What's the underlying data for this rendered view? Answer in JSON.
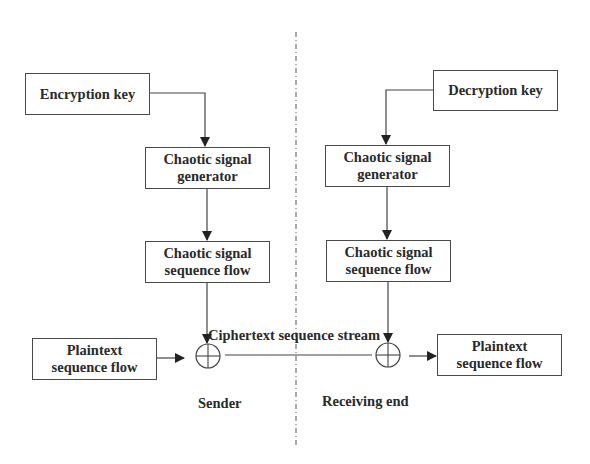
{
  "diagram": {
    "type": "flowchart",
    "divider": "dashed vertical line separating sender and receiver",
    "sender": {
      "label": "Sender",
      "key": "Encryption key",
      "generator": "Chaotic signal generator",
      "generator_lines": [
        "Chaotic signal",
        "generator"
      ],
      "sequence": "Chaotic signal sequence flow",
      "sequence_lines": [
        "Chaotic signal",
        "sequence flow"
      ],
      "plaintext_lines": [
        "Plaintext",
        "sequence flow"
      ]
    },
    "receiver": {
      "label": "Receiving end",
      "key": "Decryption key",
      "generator_lines": [
        "Chaotic signal",
        "generator"
      ],
      "sequence_lines": [
        "Chaotic signal",
        "sequence flow"
      ],
      "plaintext_lines": [
        "Plaintext",
        "sequence flow"
      ]
    },
    "channel_label": "Ciphertext sequence stream",
    "operator": "XOR (⊕)",
    "edges": [
      [
        "Encryption key",
        "Chaotic signal generator (sender)"
      ],
      [
        "Chaotic signal generator (sender)",
        "Chaotic signal sequence flow (sender)"
      ],
      [
        "Chaotic signal sequence flow (sender)",
        "XOR (sender)"
      ],
      [
        "Plaintext sequence flow (sender)",
        "XOR (sender)"
      ],
      [
        "XOR (sender)",
        "XOR (receiver)"
      ],
      [
        "Decryption key",
        "Chaotic signal generator (receiver)"
      ],
      [
        "Chaotic signal generator (receiver)",
        "Chaotic signal sequence flow (receiver)"
      ],
      [
        "Chaotic signal sequence flow (receiver)",
        "XOR (receiver)"
      ],
      [
        "XOR (receiver)",
        "Plaintext sequence flow (receiver)"
      ]
    ]
  }
}
